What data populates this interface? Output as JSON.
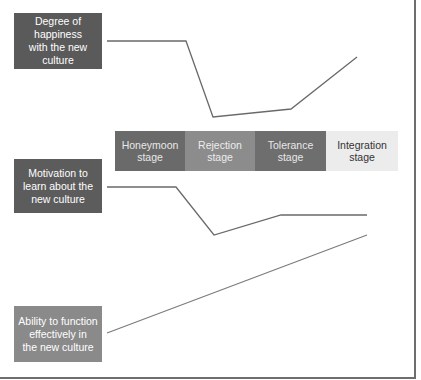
{
  "labels": {
    "happiness": "Degree of\nhappiness\nwith the new\nculture",
    "motivation": "Motivation to\nlearn about the\nnew culture",
    "ability": "Ability to function\neffectively in\nthe new culture"
  },
  "stages": [
    {
      "label": "Honeymoon\nstage"
    },
    {
      "label": "Rejection\nstage"
    },
    {
      "label": "Tolerance\nstage"
    },
    {
      "label": "Integration\nstage"
    }
  ],
  "colors": {
    "line": "#6a6a6a",
    "dark_box": "#5a5a5a",
    "light_box": "#8a8a8a",
    "integration_bg": "#ececec"
  },
  "curves": {
    "happiness": "107,41 186,41 213,117 291,109 357,57",
    "motivation": "107,187 176,187 214,235 281,215 367,215",
    "ability": "107,333 367,235"
  }
}
